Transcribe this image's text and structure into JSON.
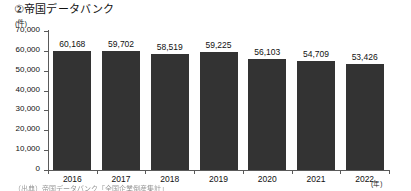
{
  "chart_data": {
    "type": "bar",
    "title": "②帝国データバンク",
    "xlabel": "(年)",
    "ylabel": "(件)",
    "categories": [
      "2016",
      "2017",
      "2018",
      "2019",
      "2020",
      "2021",
      "2022"
    ],
    "values": [
      60168,
      59702,
      58519,
      59225,
      56103,
      54709,
      53426
    ],
    "value_labels": [
      "60,168",
      "59,702",
      "58,519",
      "59,225",
      "56,103",
      "54,709",
      "53,426"
    ],
    "ylim": [
      0,
      70000
    ],
    "ytick_values": [
      70000,
      60000,
      50000,
      40000,
      30000,
      20000,
      10000,
      0
    ],
    "ytick_labels": [
      "70,000",
      "60,000",
      "50,000",
      "40,000",
      "30,000",
      "20,000",
      "10,000",
      "0"
    ],
    "grid": false,
    "legend": null,
    "bar_color": "#333333",
    "axis_color": "#5a5a5a"
  },
  "footnote": {
    "text": "（出典）帝国データバンク「全国企業倒産集計」"
  }
}
